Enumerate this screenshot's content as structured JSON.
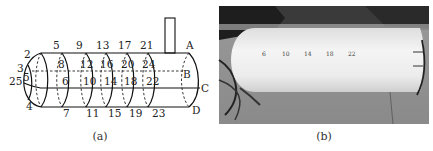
{
  "figure": {
    "panel_a": {
      "caption": "(a)",
      "description": "Schematic of cylindrical hull with hemispherical nose showing numbered measurement points",
      "point_labels": {
        "top": [
          "5",
          "9",
          "13",
          "17",
          "21"
        ],
        "upper_inner": [
          "8",
          "12",
          "16",
          "20",
          "24"
        ],
        "mid_inner": [
          "6",
          "10",
          "14",
          "18",
          "22"
        ],
        "bottom": [
          "7",
          "11",
          "15",
          "19",
          "23"
        ],
        "nose": [
          "2",
          "3",
          "25",
          "5",
          "4"
        ],
        "tail": [
          "A",
          "B",
          "C",
          "D"
        ]
      }
    },
    "panel_b": {
      "caption": "(b)",
      "description": "Photograph of white cylindrical model with hemispherical nose and marked sensor points",
      "marks": [
        "6",
        "10",
        "14",
        "18",
        "22"
      ]
    }
  }
}
